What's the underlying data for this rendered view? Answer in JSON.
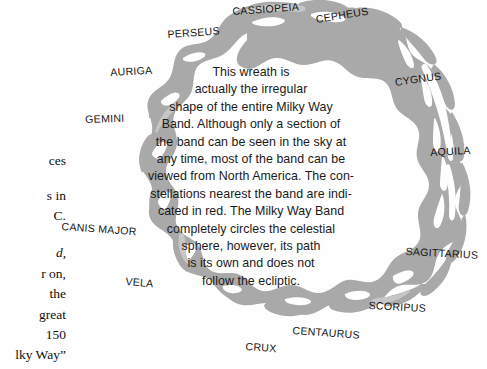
{
  "figure": {
    "graphic_name": "milky-way-band-wreath",
    "band_color": "#a9a9a9",
    "band_color_light": "#c6c6c6",
    "background_color": "#ffffff",
    "text_color": "#1b1b1b"
  },
  "caption": {
    "lines": [
      "This wreath is",
      "actually the irregular",
      "shape of the entire Milky Way",
      "Band. Although only a section of",
      "the band can be seen in the sky at",
      "any time, most of the band can be",
      "viewed from North America. The con-",
      "stellations nearest the band are indi-",
      "cated in red. The Milky Way Band",
      "completely circles the celestial",
      "sphere, however, its path",
      "is its own and does not",
      "follow the ecliptic."
    ]
  },
  "constellations": [
    {
      "label": "CASSIOPEIA",
      "x": 232,
      "y": 5,
      "rotate": -4
    },
    {
      "label": "CEPHEUS",
      "x": 315,
      "y": 13,
      "rotate": -9
    },
    {
      "label": "PERSEUS",
      "x": 167,
      "y": 28,
      "rotate": -4
    },
    {
      "label": "CYGNUS",
      "x": 394,
      "y": 76,
      "rotate": -8
    },
    {
      "label": "AURIGA",
      "x": 110,
      "y": 66,
      "rotate": -3
    },
    {
      "label": "GEMINI",
      "x": 85,
      "y": 113,
      "rotate": -2
    },
    {
      "label": "AQUILA",
      "x": 430,
      "y": 146,
      "rotate": -3
    },
    {
      "label": "CANIS MAJOR",
      "x": 62,
      "y": 220,
      "rotate": 4
    },
    {
      "label": "SAGITTARIUS",
      "x": 406,
      "y": 245,
      "rotate": 3
    },
    {
      "label": "VELA",
      "x": 126,
      "y": 275,
      "rotate": 5
    },
    {
      "label": "SCORIPUS",
      "x": 369,
      "y": 299,
      "rotate": 3
    },
    {
      "label": "CENTAURUS",
      "x": 293,
      "y": 324,
      "rotate": 4
    },
    {
      "label": "CRUX",
      "x": 246,
      "y": 340,
      "rotate": 4
    }
  ],
  "body_text": {
    "lines": [
      {
        "text": "ces",
        "y": 151,
        "italic": false
      },
      {
        "text": "s in",
        "y": 186,
        "italic": false
      },
      {
        "text": "C.",
        "y": 206,
        "italic": false
      },
      {
        "text": "d,",
        "y": 243,
        "italic": true
      },
      {
        "text": "r on,",
        "y": 264,
        "italic": false
      },
      {
        "text": "the",
        "y": 284,
        "italic": false
      },
      {
        "text": "great",
        "y": 305,
        "italic": false
      },
      {
        "text": "150",
        "y": 325,
        "italic": false
      },
      {
        "text": "lky Way”",
        "y": 345,
        "italic": false
      },
      {
        "text": "middle ono",
        "y": 364,
        "italic": false
      }
    ]
  }
}
